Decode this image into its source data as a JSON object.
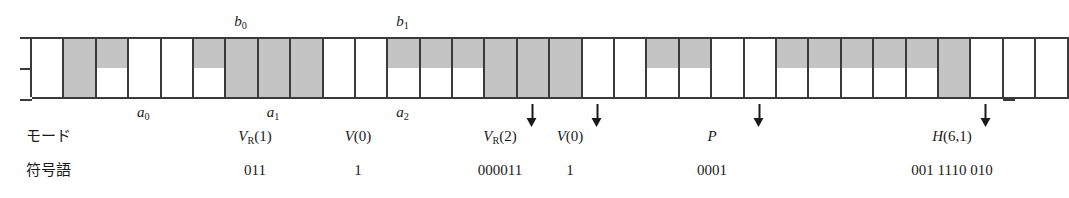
{
  "figure": {
    "kind": "two-row-pixel-run-diagram",
    "columns": 32,
    "grid": {
      "top_row_name": "reference-line",
      "bottom_row_name": "coding-line",
      "shade_color": "#c4c4c4",
      "blank_color": "#ffffff",
      "line_color": "#3a3a3a",
      "top_row": [
        "white",
        "shaded",
        "shaded",
        "white",
        "white",
        "shaded",
        "shaded",
        "shaded",
        "shaded",
        "white",
        "white",
        "shaded",
        "shaded",
        "shaded",
        "shaded",
        "shaded",
        "shaded",
        "white",
        "white",
        "shaded",
        "shaded",
        "white",
        "white",
        "shaded",
        "shaded",
        "shaded",
        "shaded",
        "shaded",
        "shaded",
        "white",
        "white",
        "white"
      ],
      "bottom_row": [
        "white",
        "shaded",
        "white",
        "white",
        "white",
        "white",
        "shaded",
        "shaded",
        "shaded",
        "white",
        "white",
        "white",
        "white",
        "white",
        "shaded",
        "shaded",
        "shaded",
        "white",
        "white",
        "white",
        "white",
        "white",
        "white",
        "white",
        "white",
        "white",
        "white",
        "white",
        "shaded",
        "white",
        "white",
        "white"
      ]
    },
    "top_labels": [
      {
        "name": "b0",
        "text": "b",
        "sub": "0",
        "column": 6
      },
      {
        "name": "b1",
        "text": "b",
        "sub": "1",
        "column": 11
      }
    ],
    "bottom_labels": [
      {
        "name": "a0",
        "text": "a",
        "sub": "0",
        "column": 3
      },
      {
        "name": "a1",
        "text": "a",
        "sub": "1",
        "column": 7
      },
      {
        "name": "a2",
        "text": "a",
        "sub": "2",
        "column": 11
      }
    ],
    "arrows": [
      {
        "name": "arrow-vr2",
        "column": 15
      },
      {
        "name": "arrow-v0-second",
        "column": 17
      },
      {
        "name": "arrow-p",
        "column": 22
      },
      {
        "name": "arrow-h61",
        "column": 29
      }
    ]
  },
  "rows": {
    "mode_label": "モード",
    "codeword_label": "符号語"
  },
  "modes": [
    {
      "name": "mode-vr1",
      "main": "V",
      "sub": "R",
      "arg": "(1)",
      "x": 255
    },
    {
      "name": "mode-v0-first",
      "main": "V",
      "sub": "",
      "arg": "(0)",
      "x": 358
    },
    {
      "name": "mode-vr2",
      "main": "V",
      "sub": "R",
      "arg": "(2)",
      "x": 500
    },
    {
      "name": "mode-v0-second",
      "main": "V",
      "sub": "",
      "arg": "(0)",
      "x": 570
    },
    {
      "name": "mode-p",
      "main": "P",
      "sub": "",
      "arg": "",
      "x": 712
    },
    {
      "name": "mode-h61",
      "main": "H",
      "sub": "",
      "arg": "(6,1)",
      "x": 952
    }
  ],
  "codewords": [
    {
      "name": "codeword-vr1",
      "text": "011",
      "x": 255
    },
    {
      "name": "codeword-v0-first",
      "text": "1",
      "x": 358
    },
    {
      "name": "codeword-vr2",
      "text": "000011",
      "x": 500
    },
    {
      "name": "codeword-v0-second",
      "text": "1",
      "x": 570
    },
    {
      "name": "codeword-p",
      "text": "0001",
      "x": 712
    },
    {
      "name": "codeword-h61",
      "text": "001 1110 010",
      "x": 952
    }
  ]
}
